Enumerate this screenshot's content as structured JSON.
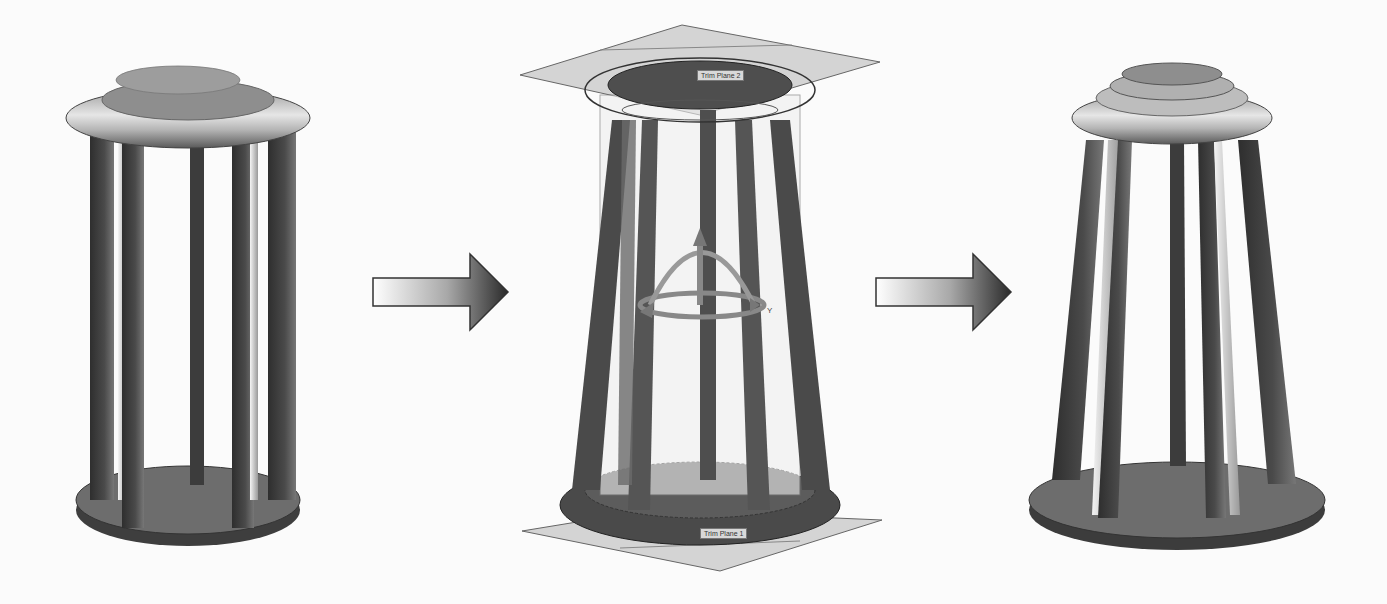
{
  "diagram": {
    "type": "process-flow",
    "stages": [
      {
        "id": "original",
        "name": "Original cylindrical model",
        "legs": 6
      },
      {
        "id": "flex-preview",
        "name": "Flex operation preview with trim planes and triad",
        "trim_planes": [
          {
            "label": "Trim Plane 2",
            "position": "top"
          },
          {
            "label": "Trim Plane 1",
            "position": "bottom"
          }
        ],
        "triad_axis_label": "Y"
      },
      {
        "id": "result",
        "name": "Tapered result model",
        "legs": 6
      }
    ],
    "arrows": [
      {
        "from": "original",
        "to": "flex-preview"
      },
      {
        "from": "flex-preview",
        "to": "result"
      }
    ]
  },
  "colors": {
    "background": "#fbfbfb",
    "leg_dark": "#3a3a3a",
    "leg_mid": "#6a6a6a",
    "cap_light": "#c8c8c8",
    "base": "#5e5e5e",
    "plane": "#d2d2d2",
    "arrow_dark": "#2a2a2a",
    "arrow_light": "#ffffff"
  }
}
